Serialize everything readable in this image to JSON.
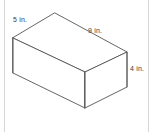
{
  "figure": {
    "kind": "rectangular-prism-isometric",
    "title": "",
    "background_color": "#ffffff",
    "line_color": "#555555",
    "label_color": "#3d3d3d",
    "frame_color": "#d6d6d6",
    "labels": {
      "depth": "5 in.",
      "length": "9 in.",
      "height": "4 in."
    },
    "dimensions": [
      {
        "name": "depth",
        "value": 5,
        "unit": "in.",
        "text": "5 in."
      },
      {
        "name": "length",
        "value": 9,
        "unit": "in.",
        "text": "9 in."
      },
      {
        "name": "height",
        "value": 4,
        "unit": "in.",
        "text": "4 in."
      }
    ],
    "vertices": {
      "top_back": [
        55,
        13
      ],
      "top_left": [
        13,
        38
      ],
      "top_front": [
        85,
        72
      ],
      "top_right": [
        127,
        52
      ],
      "bottom_left": [
        13,
        73
      ],
      "bottom_front": [
        85,
        108
      ],
      "bottom_right": [
        127,
        87
      ]
    }
  }
}
